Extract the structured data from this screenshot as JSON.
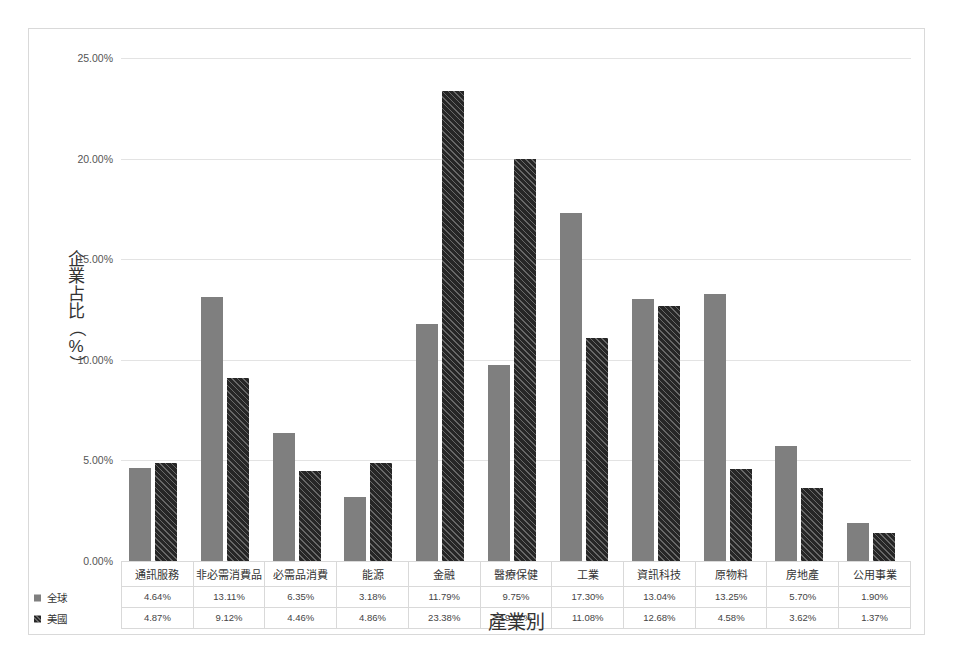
{
  "chart_data": {
    "type": "bar",
    "title": "",
    "xlabel": "產業別",
    "ylabel": "企業占比（%）",
    "ylabel_chars": [
      "企",
      "業",
      "占",
      "比",
      "（",
      "%",
      "）"
    ],
    "categories": [
      "通訊服務",
      "非必需消費品",
      "必需品消費",
      "能源",
      "金融",
      "醫療保健",
      "工業",
      "資訊科技",
      "原物料",
      "房地產",
      "公用事業"
    ],
    "series": [
      {
        "name": "全球",
        "color": "#7f7f7f",
        "values": [
          4.64,
          13.11,
          6.35,
          3.18,
          11.79,
          9.75,
          17.3,
          13.04,
          13.25,
          5.7,
          1.9
        ],
        "labels": [
          "4.64%",
          "13.11%",
          "6.35%",
          "3.18%",
          "11.79%",
          "9.75%",
          "17.30%",
          "13.04%",
          "13.25%",
          "5.70%",
          "1.90%"
        ]
      },
      {
        "name": "美國",
        "color": "#262626",
        "values": [
          4.87,
          9.12,
          4.46,
          4.86,
          23.38,
          19.97,
          11.08,
          12.68,
          4.58,
          3.62,
          1.37
        ],
        "labels": [
          "4.87%",
          "9.12%",
          "4.46%",
          "4.86%",
          "23.38%",
          "19.97%",
          "11.08%",
          "12.68%",
          "4.58%",
          "3.62%",
          "1.37%"
        ]
      }
    ],
    "ylim": [
      0,
      25
    ],
    "ytick_values": [
      0,
      5,
      10,
      15,
      20,
      25
    ],
    "ytick_labels": [
      "0.00%",
      "5.00%",
      "10.00%",
      "15.00%",
      "20.00%",
      "25.00%"
    ],
    "grid": true,
    "legend_position": "data-table-left",
    "data_table_visible": true
  }
}
